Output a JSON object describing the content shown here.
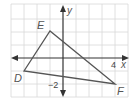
{
  "diagram": {
    "type": "coordinate-plane-triangle",
    "grid": {
      "x_range": [
        -4,
        5
      ],
      "y_range": [
        -3,
        4
      ],
      "spacing_px": 13,
      "origin_px": [
        63,
        58
      ],
      "grid_color": "#d8d8d8",
      "axis_color": "#333333",
      "shape_color": "#555555"
    },
    "axes": {
      "x_label": "x",
      "y_label": "y",
      "x_tick_label": "4",
      "y_tick_label": "−2"
    },
    "triangle": {
      "vertices": [
        {
          "name": "D",
          "x": -3,
          "y": -1
        },
        {
          "name": "E",
          "x": -1,
          "y": 2
        },
        {
          "name": "F",
          "x": 4,
          "y": -2
        }
      ]
    },
    "labels": {
      "D": "D",
      "E": "E",
      "F": "F"
    }
  }
}
